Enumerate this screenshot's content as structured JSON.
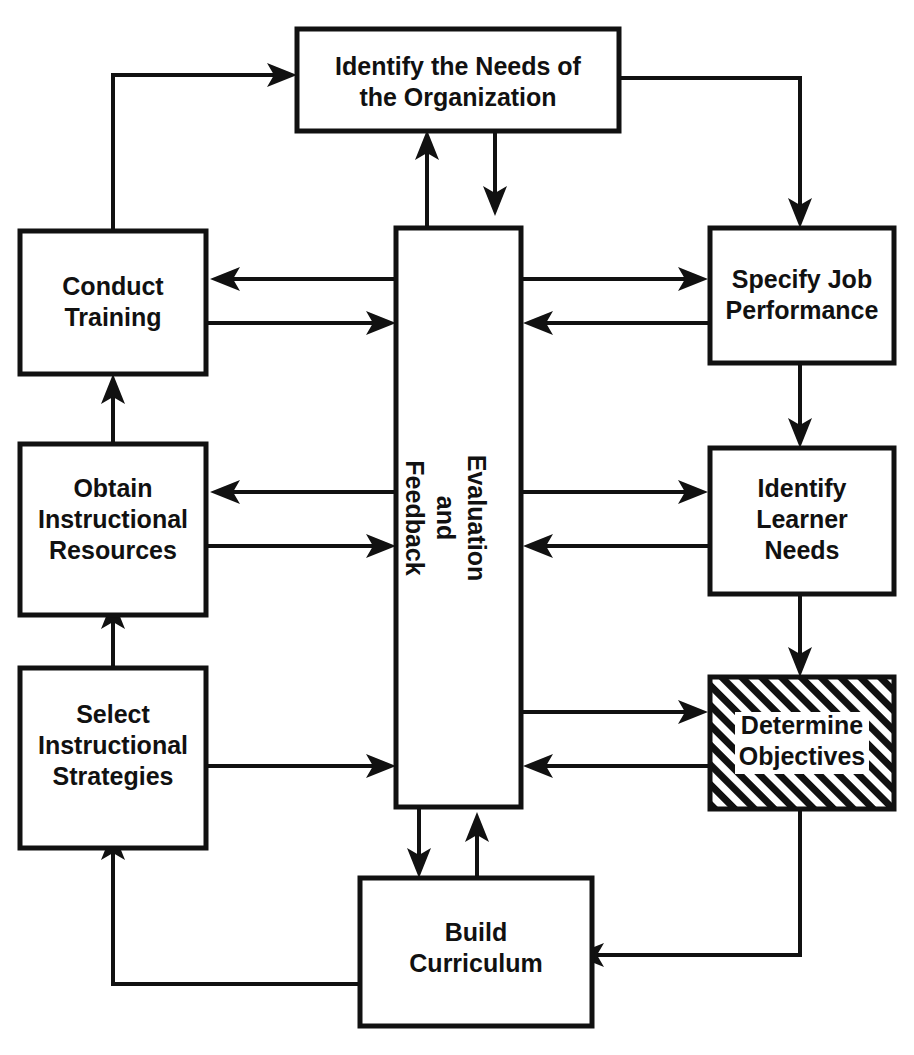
{
  "diagram": {
    "type": "flowchart",
    "background_color": "#ffffff",
    "line_color": "#111111",
    "nodes": [
      {
        "id": "identify-needs-organization",
        "lines": [
          "Identify the Needs of",
          "the Organization"
        ],
        "style": "plain"
      },
      {
        "id": "conduct-training",
        "lines": [
          "Conduct",
          "Training"
        ],
        "style": "plain"
      },
      {
        "id": "specify-job-performance",
        "lines": [
          "Specify Job",
          "Performance"
        ],
        "style": "plain"
      },
      {
        "id": "obtain-instructional-resources",
        "lines": [
          "Obtain",
          "Instructional",
          "Resources"
        ],
        "style": "plain"
      },
      {
        "id": "identify-learner-needs",
        "lines": [
          "Identify",
          "Learner",
          "Needs"
        ],
        "style": "plain"
      },
      {
        "id": "select-instructional-strategies",
        "lines": [
          "Select",
          "Instructional",
          "Strategies"
        ],
        "style": "plain"
      },
      {
        "id": "determine-objectives",
        "lines": [
          "Determine",
          "Objectives"
        ],
        "style": "hatched"
      },
      {
        "id": "build-curriculum",
        "lines": [
          "Build",
          "Curriculum"
        ],
        "style": "plain"
      },
      {
        "id": "evaluation-and-feedback",
        "lines": [
          "Evaluation",
          "and",
          "Feedback"
        ],
        "style": "plain-rotated"
      }
    ],
    "edges": [
      {
        "from": "conduct-training",
        "to": "identify-needs-organization"
      },
      {
        "from": "identify-needs-organization",
        "to": "specify-job-performance"
      },
      {
        "from": "evaluation-and-feedback",
        "to": "identify-needs-organization"
      },
      {
        "from": "identify-needs-organization",
        "to": "evaluation-and-feedback"
      },
      {
        "from": "evaluation-and-feedback",
        "to": "conduct-training"
      },
      {
        "from": "conduct-training",
        "to": "evaluation-and-feedback"
      },
      {
        "from": "evaluation-and-feedback",
        "to": "specify-job-performance"
      },
      {
        "from": "specify-job-performance",
        "to": "evaluation-and-feedback"
      },
      {
        "from": "specify-job-performance",
        "to": "identify-learner-needs"
      },
      {
        "from": "evaluation-and-feedback",
        "to": "obtain-instructional-resources"
      },
      {
        "from": "obtain-instructional-resources",
        "to": "evaluation-and-feedback"
      },
      {
        "from": "evaluation-and-feedback",
        "to": "identify-learner-needs"
      },
      {
        "from": "identify-learner-needs",
        "to": "evaluation-and-feedback"
      },
      {
        "from": "identify-learner-needs",
        "to": "determine-objectives"
      },
      {
        "from": "obtain-instructional-resources",
        "to": "conduct-training"
      },
      {
        "from": "select-instructional-strategies",
        "to": "obtain-instructional-resources"
      },
      {
        "from": "evaluation-and-feedback",
        "to": "determine-objectives"
      },
      {
        "from": "determine-objectives",
        "to": "evaluation-and-feedback"
      },
      {
        "from": "select-instructional-strategies",
        "to": "evaluation-and-feedback"
      },
      {
        "from": "evaluation-and-feedback",
        "to": "build-curriculum"
      },
      {
        "from": "build-curriculum",
        "to": "evaluation-and-feedback"
      },
      {
        "from": "determine-objectives",
        "to": "build-curriculum"
      },
      {
        "from": "build-curriculum",
        "to": "select-instructional-strategies"
      }
    ]
  }
}
